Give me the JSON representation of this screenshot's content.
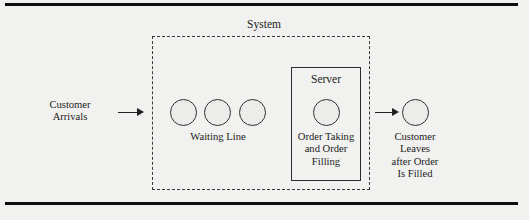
{
  "figure": {
    "background_color": "#f1f1ef",
    "rule_color": "#0d0d0d",
    "line_color": "#2f2f2f",
    "circle_fill": "#ececeb"
  },
  "system": {
    "label": "System",
    "border_style": "dashed"
  },
  "server": {
    "label": "Server",
    "caption": "Order Taking and Order Filling",
    "caption_lines": [
      "Order Taking",
      "and Order",
      "Filling"
    ],
    "border_style": "solid"
  },
  "waiting_line": {
    "label": "Waiting Line",
    "customer_count": 3,
    "customers": [
      {
        "name": "waiting-customer-1",
        "cx": 183,
        "cy": 112,
        "r": 13.5
      },
      {
        "name": "waiting-customer-2",
        "cx": 217,
        "cy": 112,
        "r": 13.5
      },
      {
        "name": "waiting-customer-3",
        "cx": 252,
        "cy": 112,
        "r": 13.5
      }
    ]
  },
  "server_customer": {
    "name": "in-service-customer",
    "cx": 326,
    "cy": 112,
    "r": 13.5
  },
  "exit_customer": {
    "name": "departing-customer",
    "cx": 415,
    "cy": 112,
    "r": 13.5
  },
  "arrivals": {
    "label": "Customer Arrivals",
    "lines": [
      "Customer",
      "Arrivals"
    ],
    "arrow": "arrow-right"
  },
  "departure": {
    "label": "Customer Leaves after Order Is Filled",
    "lines": [
      "Customer",
      "Leaves",
      "after Order",
      "Is Filled"
    ],
    "arrow": "arrow-right"
  }
}
